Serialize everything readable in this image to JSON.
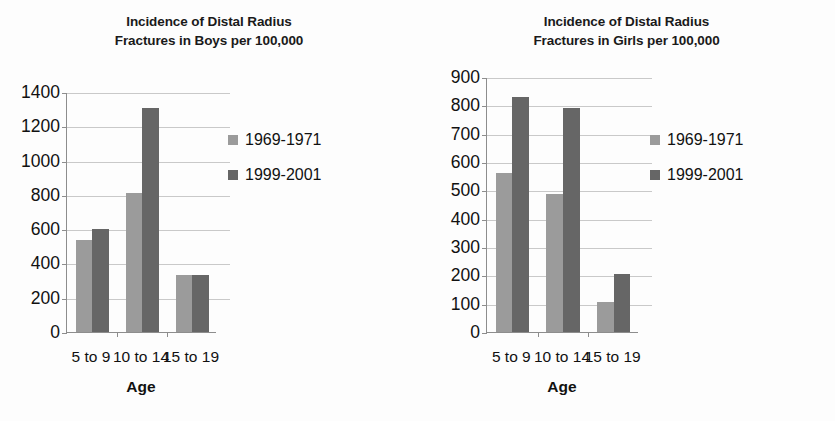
{
  "figure": {
    "background_color": "#fdfdfd",
    "series_colors": {
      "1969-1971": "#9b9b9b",
      "1999-2001": "#666666"
    }
  },
  "chart_data": [
    {
      "type": "bar",
      "id": "boys",
      "title": "Incidence of Distal Radius Fractures in Boys per 100,000",
      "title_line1": "Incidence of Distal Radius",
      "title_line2": "Fractures in Boys per 100,000",
      "categories": [
        "5 to 9",
        "10 to 14",
        "15 to 19"
      ],
      "series": [
        {
          "name": "1969-1971",
          "color": "#9b9b9b",
          "values": [
            535,
            810,
            335
          ]
        },
        {
          "name": "1999-2001",
          "color": "#666666",
          "values": [
            600,
            1305,
            335
          ]
        }
      ],
      "xlabel": "Age",
      "ylabel": "",
      "ylim": [
        0,
        1400
      ],
      "yticks": [
        0,
        200,
        400,
        600,
        800,
        1000,
        1200,
        1400
      ],
      "ytick_labels": [
        "0",
        "200",
        "400",
        "600",
        "800",
        "1000",
        "1200",
        "1400"
      ],
      "grid": true,
      "legend_position": "inside-right",
      "legend_entries": [
        "1969-1971",
        "1999-2001"
      ]
    },
    {
      "type": "bar",
      "id": "girls",
      "title": "Incidence of Distal Radius Fractures in Girls per 100,000",
      "title_line1": "Incidence of Distal Radius",
      "title_line2": "Fractures in Girls per 100,000",
      "categories": [
        "5 to 9",
        "10 to 14",
        "15 to 19"
      ],
      "series": [
        {
          "name": "1969-1971",
          "color": "#9b9b9b",
          "values": [
            562,
            487,
            107
          ]
        },
        {
          "name": "1999-2001",
          "color": "#666666",
          "values": [
            828,
            790,
            205
          ]
        }
      ],
      "xlabel": "Age",
      "ylabel": "",
      "ylim": [
        0,
        900
      ],
      "yticks": [
        0,
        100,
        200,
        300,
        400,
        500,
        600,
        700,
        800,
        900
      ],
      "ytick_labels": [
        "0",
        "100",
        "200",
        "300",
        "400",
        "500",
        "600",
        "700",
        "800",
        "900"
      ],
      "grid": true,
      "legend_position": "inside-right",
      "legend_entries": [
        "1969-1971",
        "1999-2001"
      ]
    }
  ]
}
